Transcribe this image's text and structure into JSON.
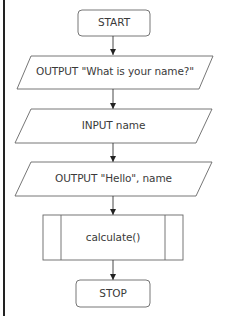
{
  "diagram": {
    "type": "flowchart",
    "colors": {
      "stroke": "#555555",
      "text": "#3a3a3a",
      "background": "#ffffff",
      "frame": "#222222"
    },
    "nodes": [
      {
        "id": "start",
        "shape": "terminator",
        "label": "START"
      },
      {
        "id": "out1",
        "shape": "io",
        "label": "OUTPUT \"What is your name?\""
      },
      {
        "id": "in1",
        "shape": "io",
        "label": "INPUT name"
      },
      {
        "id": "out2",
        "shape": "io",
        "label": "OUTPUT \"Hello\", name"
      },
      {
        "id": "calc",
        "shape": "predefined-process",
        "label": "calculate()"
      },
      {
        "id": "stop",
        "shape": "terminator",
        "label": "STOP"
      }
    ],
    "edges": [
      {
        "from": "start",
        "to": "out1"
      },
      {
        "from": "out1",
        "to": "in1"
      },
      {
        "from": "in1",
        "to": "out2"
      },
      {
        "from": "out2",
        "to": "calc"
      },
      {
        "from": "calc",
        "to": "stop"
      }
    ]
  }
}
